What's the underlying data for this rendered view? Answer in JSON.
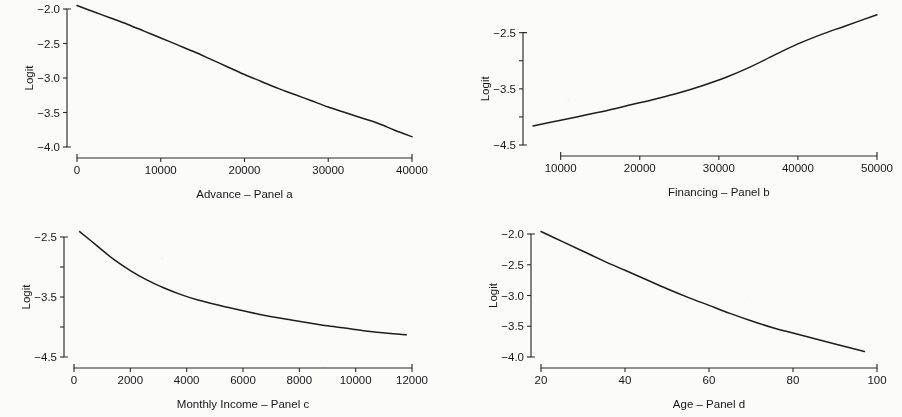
{
  "figure": {
    "background": "#fbfbfa",
    "ink_color": "#1d1d1d",
    "ylabel_text": "Logit",
    "layout": "2x2 grid of line plots"
  },
  "chart_data": [
    {
      "id": "panel-a",
      "type": "line",
      "title": "",
      "xlabel": "Advance – Panel a",
      "ylabel": "Logit",
      "grid": false,
      "legend": "none",
      "xlim": [
        0,
        40000
      ],
      "ylim": [
        -4.0,
        -2.0
      ],
      "xticks": [
        0,
        10000,
        20000,
        30000,
        40000
      ],
      "xticklabels": [
        "0",
        "10000",
        "20000",
        "30000",
        "40000"
      ],
      "yticks": [
        -2.0,
        -2.5,
        -3.0,
        -3.5,
        -4.0
      ],
      "yticklabels": [
        "-2.0",
        "-2.5",
        "-3.0",
        "-3.5",
        "-4.0"
      ],
      "x": [
        0,
        2000,
        4000,
        6000,
        8000,
        10000,
        12000,
        14000,
        16000,
        18000,
        20000,
        22000,
        24000,
        26000,
        28000,
        30000,
        32000,
        34000,
        36000,
        38000,
        40000
      ],
      "y": [
        -1.95,
        -2.04,
        -2.13,
        -2.22,
        -2.32,
        -2.42,
        -2.52,
        -2.62,
        -2.73,
        -2.84,
        -2.95,
        -3.05,
        -3.15,
        -3.24,
        -3.33,
        -3.42,
        -3.5,
        -3.58,
        -3.66,
        -3.76,
        -3.85
      ]
    },
    {
      "id": "panel-b",
      "type": "line",
      "title": "",
      "xlabel": "Financing – Panel b",
      "ylabel": "Logit",
      "grid": false,
      "legend": "none",
      "xlim": [
        6500,
        50000
      ],
      "ylim": [
        -4.5,
        -2.15
      ],
      "xticks": [
        10000,
        20000,
        30000,
        40000,
        50000
      ],
      "xticklabels": [
        "10000",
        "20000",
        "30000",
        "40000",
        "50000"
      ],
      "yticks": [
        -2.5,
        -3.5,
        -4.5
      ],
      "yticklabels": [
        "-2.5",
        "-3.5",
        "-4.5"
      ],
      "x": [
        6500,
        10000,
        13000,
        16000,
        19000,
        22000,
        25000,
        28000,
        31000,
        34000,
        37000,
        40000,
        43000,
        46000,
        50000
      ],
      "y": [
        -4.16,
        -4.06,
        -3.97,
        -3.88,
        -3.78,
        -3.68,
        -3.57,
        -3.44,
        -3.29,
        -3.11,
        -2.9,
        -2.7,
        -2.53,
        -2.38,
        -2.18
      ]
    },
    {
      "id": "panel-c",
      "type": "line",
      "title": "",
      "xlabel": "Monthly Income  – Panel c",
      "ylabel": "Logit",
      "grid": false,
      "legend": "none",
      "xlim": [
        0,
        12000
      ],
      "ylim": [
        -4.5,
        -2.3
      ],
      "xticks": [
        0,
        2000,
        4000,
        6000,
        8000,
        10000,
        12000
      ],
      "xticklabels": [
        "0",
        "2000",
        "4000",
        "6000",
        "8000",
        "10000",
        "12000"
      ],
      "yticks": [
        -2.5,
        -3.5,
        -4.5
      ],
      "yticklabels": [
        "-2.5",
        "-3.5",
        "-4.5"
      ],
      "x": [
        200,
        800,
        1400,
        2000,
        2600,
        3200,
        3800,
        4400,
        5000,
        5800,
        6600,
        7400,
        8200,
        9000,
        9800,
        10600,
        11800
      ],
      "y": [
        -2.41,
        -2.64,
        -2.87,
        -3.06,
        -3.22,
        -3.35,
        -3.46,
        -3.55,
        -3.62,
        -3.71,
        -3.79,
        -3.86,
        -3.92,
        -3.98,
        -4.03,
        -4.08,
        -4.13
      ]
    },
    {
      "id": "panel-d",
      "type": "line",
      "title": "",
      "xlabel": "Age – Panel d",
      "ylabel": "Logit",
      "grid": false,
      "legend": "none",
      "xlim": [
        20,
        100
      ],
      "ylim": [
        -4.0,
        -2.0
      ],
      "xticks": [
        20,
        40,
        60,
        80,
        100
      ],
      "xticklabels": [
        "20",
        "40",
        "60",
        "80",
        "100"
      ],
      "yticks": [
        -2.0,
        -2.5,
        -3.0,
        -3.5,
        -4.0
      ],
      "yticklabels": [
        "-2.0",
        "-2.5",
        "-3.0",
        "-3.5",
        "-4.0"
      ],
      "x": [
        20,
        25,
        30,
        35,
        40,
        45,
        50,
        55,
        60,
        65,
        70,
        75,
        80,
        85,
        90,
        97
      ],
      "y": [
        -1.96,
        -2.12,
        -2.28,
        -2.44,
        -2.59,
        -2.74,
        -2.89,
        -3.03,
        -3.16,
        -3.29,
        -3.41,
        -3.52,
        -3.61,
        -3.7,
        -3.79,
        -3.91
      ]
    }
  ]
}
